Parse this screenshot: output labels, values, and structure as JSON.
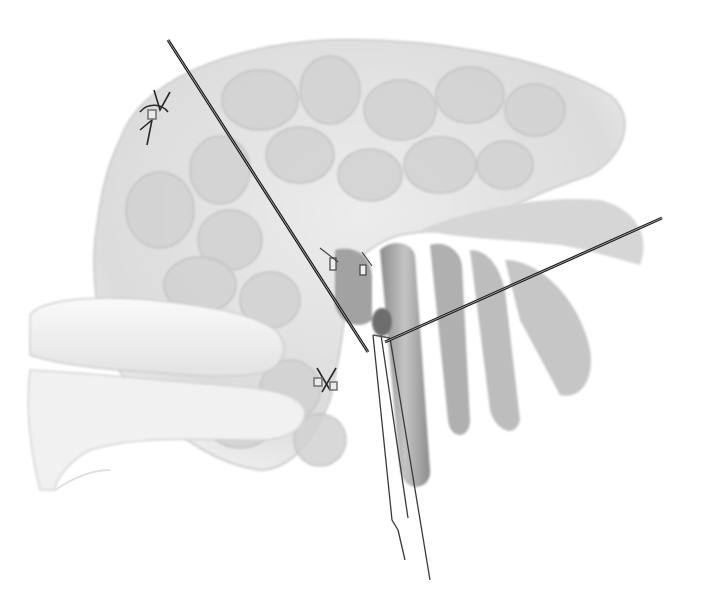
{
  "image": {
    "type": "surgical-illustration",
    "style": "grayscale pencil drawing",
    "alt": "Surgical illustration: lobulated gland retracted by two wire retractors, finger compressing tissue on left, forceps grasping a vessel near center, ligature sutures on tissue"
  },
  "elements": {
    "gland": "lobulated glandular tissue",
    "finger": "gloved finger retracting tissue",
    "retractor_left": "thin wire retractor from upper-left",
    "retractor_right": "thin wire retractor from upper-right",
    "forceps": "fine forceps grasping vessel",
    "vessels": "tubular vessels running downward",
    "sutures": [
      "suture tie upper-left",
      "suture tie lower-middle",
      "clip ties near vessel"
    ]
  },
  "colors": {
    "background": "#ffffff",
    "tissue_light": "#e6e6e6",
    "tissue_mid": "#c8c8c8",
    "tissue_dark": "#9a9a9a",
    "wire": "#1a1a1a"
  },
  "geometry": {
    "wire_left": {
      "x1": 168,
      "y1": 40,
      "x2": 368,
      "y2": 352
    },
    "wire_right": {
      "x1": 662,
      "y1": 218,
      "x2": 385,
      "y2": 342
    },
    "forceps_tip": {
      "x": 375,
      "y": 335
    },
    "forceps_end": {
      "x": 430,
      "y": 580
    }
  }
}
